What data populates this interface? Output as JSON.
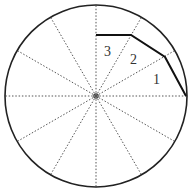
{
  "diagram": {
    "type": "circle-divided-into-12-sectors",
    "center": [
      96,
      96
    ],
    "radius": 91,
    "spoke_count": 12,
    "spoke_style": "dotted",
    "polyline": [
      [
        96,
        35
      ],
      [
        131,
        35
      ],
      [
        165,
        57
      ],
      [
        186,
        96
      ]
    ],
    "labels": [
      {
        "text": "1",
        "x": 153,
        "y": 84
      },
      {
        "text": "2",
        "x": 130,
        "y": 64
      },
      {
        "text": "3",
        "x": 104,
        "y": 56
      }
    ],
    "colors": {
      "circle": "#222222",
      "spokes": "#555555",
      "polyline": "#111111",
      "labels": "#333333"
    }
  }
}
